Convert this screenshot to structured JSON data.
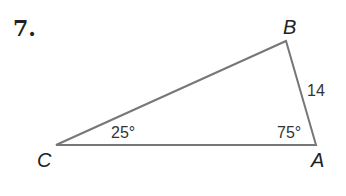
{
  "problem": {
    "number": "7.",
    "vertices": {
      "A": {
        "label": "A",
        "x": 316,
        "y": 145
      },
      "B": {
        "label": "B",
        "x": 286,
        "y": 41
      },
      "C": {
        "label": "C",
        "x": 56,
        "y": 145
      }
    },
    "side_AB": "14",
    "angle_C": "25°",
    "angle_A": "75°",
    "line_color": "#777777"
  }
}
